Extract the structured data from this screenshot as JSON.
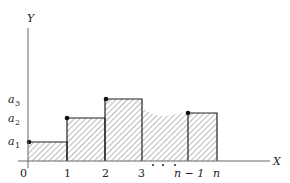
{
  "diagram": {
    "type": "step-function-area",
    "axes": {
      "x_label": "X",
      "y_label": "Y",
      "origin_label": "0"
    },
    "x_ticks": [
      "0",
      "1",
      "2",
      "3",
      "n − 1",
      "n"
    ],
    "y_ticks": [
      {
        "base": "a",
        "sub": "1"
      },
      {
        "base": "a",
        "sub": "2"
      },
      {
        "base": "a",
        "sub": "3"
      }
    ],
    "ellipsis": "· · ·",
    "bars": [
      {
        "from": "0",
        "to": "1",
        "height": "a1"
      },
      {
        "from": "1",
        "to": "2",
        "height": "a2"
      },
      {
        "from": "2",
        "to": "3",
        "height": "a3"
      },
      {
        "from": "n − 1",
        "to": "n",
        "height": "a_n"
      }
    ],
    "colors": {
      "line": "#222222",
      "hatch": "#555555",
      "background": "#ffffff"
    }
  }
}
